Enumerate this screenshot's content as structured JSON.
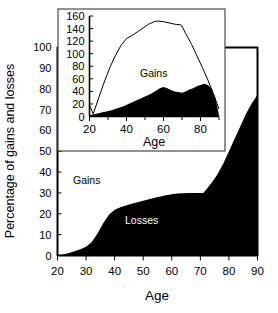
{
  "chart_data": [
    {
      "id": "main",
      "type": "area",
      "title": "",
      "xlabel": "Age",
      "ylabel": "Percentage of gains and losses",
      "xlim": [
        20,
        90
      ],
      "ylim": [
        0,
        100
      ],
      "xticks": [
        20,
        30,
        40,
        50,
        60,
        70,
        80,
        90
      ],
      "yticks": [
        0,
        10,
        20,
        30,
        40,
        50,
        60,
        70,
        80,
        90,
        100
      ],
      "grid": false,
      "legend": "inline-annotations",
      "annotations": [
        {
          "text": "Gains",
          "x": 32,
          "y": 42,
          "color": "#000000"
        },
        {
          "text": "Losses",
          "x": 51,
          "y": 14,
          "color": "#ffffff"
        }
      ],
      "series": [
        {
          "name": "Losses",
          "fill": "#000000",
          "x": [
            20,
            22,
            24,
            26,
            28,
            30,
            32,
            34,
            36,
            38,
            40,
            42,
            44,
            46,
            48,
            50,
            52,
            54,
            56,
            58,
            60,
            62,
            64,
            66,
            68,
            70,
            71,
            72,
            74,
            76,
            78,
            80,
            82,
            84,
            86,
            88,
            90
          ],
          "values": [
            0,
            0.5,
            1.2,
            2,
            3,
            4.2,
            6.5,
            10.5,
            15.5,
            19.5,
            22,
            23.2,
            24,
            24.8,
            25.5,
            26.2,
            27,
            27.7,
            28.3,
            28.9,
            29.4,
            29.7,
            29.9,
            30,
            30,
            30,
            30,
            31.5,
            35,
            39,
            44,
            50,
            56,
            62,
            68,
            73,
            77
          ]
        }
      ]
    },
    {
      "id": "inset",
      "type": "area",
      "title": "",
      "xlabel": "Age",
      "ylabel": "",
      "xlim": [
        20,
        90
      ],
      "ylim": [
        0,
        160
      ],
      "xticks": [
        20,
        40,
        60,
        80
      ],
      "xticks_minor": [
        30,
        50,
        70,
        90
      ],
      "yticks": [
        0,
        20,
        40,
        60,
        80,
        100,
        120,
        140,
        160
      ],
      "grid": false,
      "annotations": [
        {
          "text": "Gains",
          "x": 57,
          "y": 80,
          "color": "#000000"
        }
      ],
      "series": [
        {
          "name": "Gains",
          "style": "line",
          "stroke": "#000000",
          "x": [
            20,
            22,
            25,
            28,
            31,
            34,
            37,
            40,
            43,
            46,
            49,
            52,
            55,
            57,
            60,
            63,
            66,
            69,
            70,
            72,
            75,
            78,
            81,
            84,
            87,
            90
          ],
          "values": [
            18,
            4,
            30,
            55,
            78,
            97,
            113,
            124,
            129,
            135,
            141,
            147,
            151,
            152,
            151,
            149,
            147,
            146,
            144,
            132,
            116,
            97,
            78,
            58,
            36,
            12
          ]
        },
        {
          "name": "Losses",
          "style": "area",
          "fill": "#000000",
          "x": [
            20,
            23,
            26,
            29,
            32,
            35,
            38,
            41,
            44,
            47,
            50,
            53,
            56,
            58,
            60,
            62,
            64,
            66,
            68,
            70,
            72,
            74,
            76,
            78,
            80,
            82,
            84,
            86,
            88,
            90
          ],
          "values": [
            2,
            4,
            6,
            8,
            10,
            13,
            16,
            20,
            24,
            28,
            32,
            36,
            41,
            45,
            47,
            45,
            42,
            40,
            39,
            38,
            40,
            43,
            45,
            48,
            50,
            52,
            50,
            44,
            30,
            2
          ]
        }
      ]
    }
  ],
  "main_axis": {
    "ylabel": "Percentage of gains and losses",
    "xlabel": "Age",
    "ytick_labels": [
      "100",
      "90",
      "80",
      "70",
      "60",
      "50",
      "40",
      "30",
      "20",
      "10",
      "0"
    ],
    "xtick_labels": [
      "20",
      "30",
      "40",
      "50",
      "60",
      "70",
      "80",
      "90"
    ],
    "gains_label": "Gains",
    "losses_label": "Losses"
  },
  "inset_axis": {
    "xlabel": "Age",
    "ytick_labels": [
      "160",
      "140",
      "120",
      "100",
      "80",
      "60",
      "40",
      "20",
      "0"
    ],
    "xtick_labels": [
      "20",
      "40",
      "60",
      "80"
    ],
    "gains_label": "Gains"
  }
}
